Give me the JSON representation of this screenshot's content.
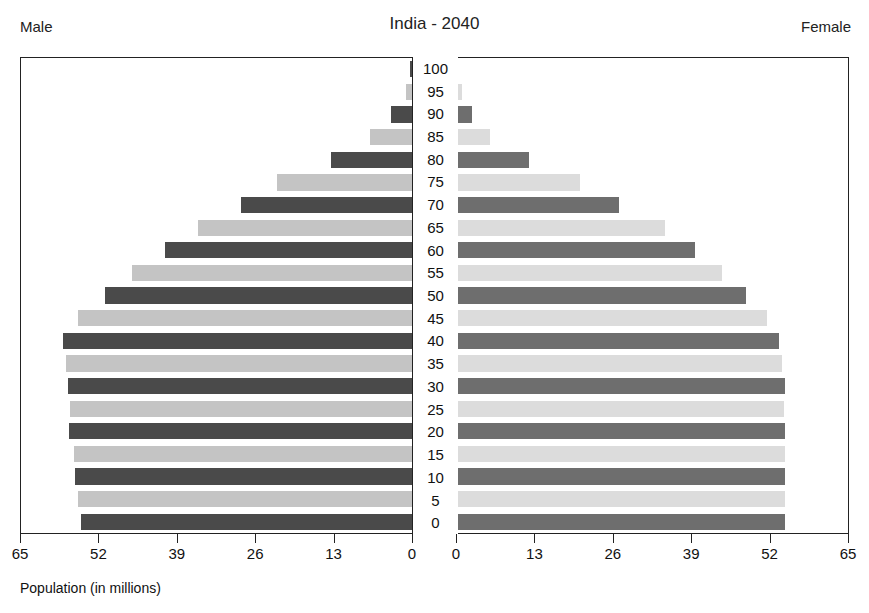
{
  "header": {
    "title": "India - 2040",
    "male_label": "Male",
    "female_label": "Female"
  },
  "axis": {
    "caption": "Population (in millions)",
    "male_ticks": [
      "65",
      "52",
      "39",
      "26",
      "13",
      "0"
    ],
    "female_ticks": [
      "0",
      "13",
      "26",
      "39",
      "52",
      "65"
    ],
    "max": 65
  },
  "colors": {
    "male_dark": "#4a4a4a",
    "male_light": "#c4c4c4",
    "female_dark": "#6e6e6e",
    "female_light": "#dcdcdc",
    "frame": "#222222",
    "text": "#111111",
    "background": "#ffffff"
  },
  "chart_data": {
    "type": "bar",
    "title": "India - 2040",
    "subtitle": "",
    "xlabel": "Population (in millions)",
    "ylabel": "Age group",
    "xlim": [
      0,
      65
    ],
    "grid": false,
    "legend": "none",
    "orientation": "horizontal-diverging",
    "categories": [
      "0",
      "5",
      "10",
      "15",
      "20",
      "25",
      "30",
      "35",
      "40",
      "45",
      "50",
      "55",
      "60",
      "65",
      "70",
      "75",
      "80",
      "85",
      "90",
      "95",
      "100"
    ],
    "series": [
      {
        "name": "Male",
        "side": "left",
        "values": [
          55.0,
          55.5,
          56.0,
          56.2,
          57.0,
          56.8,
          57.2,
          57.5,
          58.0,
          55.5,
          51.0,
          46.5,
          41.0,
          35.5,
          28.5,
          22.5,
          13.5,
          7.0,
          3.5,
          1.0,
          0.3
        ]
      },
      {
        "name": "Female",
        "side": "right",
        "values": [
          54.5,
          54.5,
          54.5,
          54.5,
          54.5,
          54.3,
          54.5,
          54.0,
          53.5,
          51.5,
          48.0,
          44.0,
          39.5,
          34.5,
          27.0,
          20.5,
          12.0,
          5.5,
          2.5,
          0.8,
          0.2
        ]
      }
    ]
  }
}
